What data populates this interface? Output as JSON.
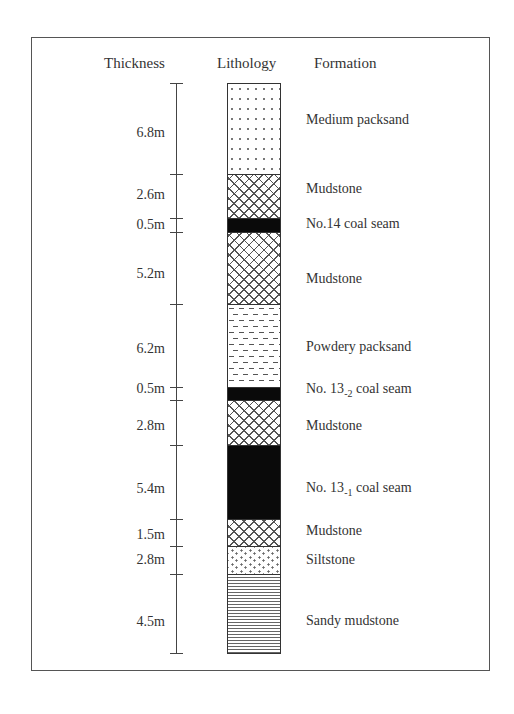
{
  "headers": {
    "thickness": "Thickness",
    "lithology": "Lithology",
    "formation": "Formation"
  },
  "layers": [
    {
      "thickness": "6.8m",
      "formation": "Medium packsand",
      "pattern": "dots",
      "top": 83,
      "bottom": 174,
      "label_y": 112,
      "thk_y": 125
    },
    {
      "thickness": "2.6m",
      "formation": "Mudstone",
      "pattern": "crosshatch",
      "top": 174,
      "bottom": 218,
      "label_y": 181,
      "thk_y": 187
    },
    {
      "thickness": "0.5m",
      "formation": "No.14 coal seam",
      "pattern": "coal",
      "top": 218,
      "bottom": 232,
      "label_y": 216,
      "thk_y": 217
    },
    {
      "thickness": "5.2m",
      "formation": "Mudstone",
      "pattern": "crosshatch",
      "top": 232,
      "bottom": 304,
      "label_y": 271,
      "thk_y": 266
    },
    {
      "thickness": "6.2m",
      "formation": "Powdery packsand",
      "pattern": "dashes",
      "top": 304,
      "bottom": 387,
      "label_y": 339,
      "thk_y": 341
    },
    {
      "thickness": "0.5m",
      "formation": "No. 13",
      "formation_sub": "-2",
      "formation_suffix": " coal seam",
      "pattern": "coal",
      "top": 387,
      "bottom": 400,
      "label_y": 381,
      "thk_y": 381
    },
    {
      "thickness": "2.8m",
      "formation": "Mudstone",
      "pattern": "crosshatch",
      "top": 400,
      "bottom": 445,
      "label_y": 418,
      "thk_y": 418
    },
    {
      "thickness": "5.4m",
      "formation": "No. 13",
      "formation_sub": "-1",
      "formation_suffix": " coal seam",
      "pattern": "coal",
      "top": 445,
      "bottom": 519,
      "label_y": 480,
      "thk_y": 481
    },
    {
      "thickness": "1.5m",
      "formation": "Mudstone",
      "pattern": "crosshatch",
      "top": 519,
      "bottom": 546,
      "label_y": 523,
      "thk_y": 527
    },
    {
      "thickness": "2.8m",
      "formation": "Siltstone",
      "pattern": "siltstone",
      "top": 546,
      "bottom": 574,
      "label_y": 552,
      "thk_y": 552
    },
    {
      "thickness": "4.5m",
      "formation": "Sandy mudstone",
      "pattern": "hlines",
      "top": 574,
      "bottom": 653,
      "label_y": 613,
      "thk_y": 614
    }
  ],
  "ticks": [
    83,
    174,
    218,
    232,
    304,
    387,
    400,
    445,
    519,
    546,
    574,
    653
  ]
}
